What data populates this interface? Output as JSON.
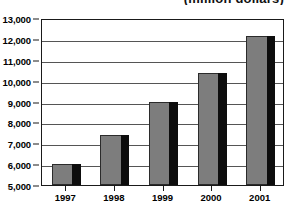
{
  "chart_data": {
    "type": "bar",
    "title": "",
    "subtitle": "(million dollars)",
    "xlabel": "",
    "ylabel": "",
    "categories": [
      "1997",
      "1998",
      "1999",
      "2000",
      "2001"
    ],
    "values": [
      6000,
      7400,
      9000,
      10350,
      12150
    ],
    "ylim": [
      5000,
      13000
    ],
    "ytick_values": [
      5000,
      6000,
      7000,
      8000,
      9000,
      10000,
      11000,
      12000,
      13000
    ],
    "ytick_labels": [
      "5,000",
      "6,000",
      "7,000",
      "8,000",
      "9,000",
      "10,000",
      "11,000",
      "12,000",
      "13,000"
    ],
    "grid": true,
    "legend": false,
    "legend_position": "none",
    "bar_face_color": "#7d7d7d",
    "bar_shadow_color": "#0d0d0d",
    "axis_color": "#1a1a1a",
    "gridline_color": "#555555",
    "background_color": "#ffffff"
  }
}
